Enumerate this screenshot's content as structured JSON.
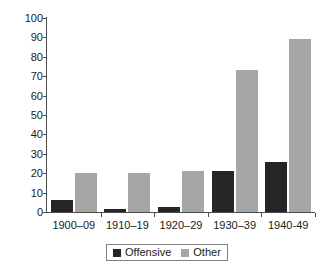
{
  "chart_data": {
    "type": "bar",
    "title": "",
    "subtitle": "",
    "xlabel": "",
    "ylabel": "",
    "categories": [
      "1900–09",
      "1910–19",
      "1920–29",
      "1930–39",
      "1940-49"
    ],
    "series": [
      {
        "name": "Offensive",
        "color": "#262626",
        "values": [
          6,
          1.5,
          2.5,
          21,
          26
        ]
      },
      {
        "name": "Other",
        "color": "#a6a6a6",
        "values": [
          20,
          20,
          21,
          73,
          89
        ]
      }
    ],
    "ylim": [
      0,
      100
    ],
    "ytick_values": [
      0,
      10,
      20,
      30,
      40,
      50,
      60,
      70,
      80,
      90,
      100
    ],
    "ytick_labels": [
      "0",
      "10",
      "20",
      "30",
      "40",
      "50",
      "60",
      "70",
      "80",
      "90",
      "100"
    ],
    "grid": false,
    "legend_position": "bottom-center"
  },
  "legend": {
    "items": [
      {
        "label": "Offensive",
        "swatch": "offensive-swatch"
      },
      {
        "label": "Other",
        "swatch": "other-swatch"
      }
    ]
  },
  "colors": {
    "offensive": "#262626",
    "other": "#a6a6a6",
    "axis": "#4d4d4d",
    "text": "#1a1a1a",
    "background": "#ffffff"
  }
}
